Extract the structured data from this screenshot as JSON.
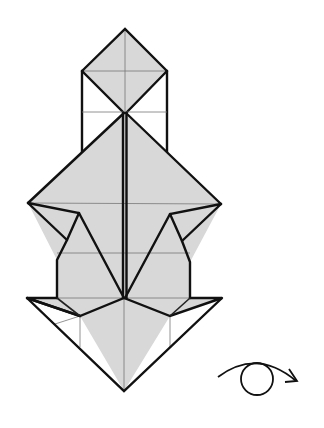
{
  "diagram": {
    "paper_fill": "#d8d8d8",
    "line_color": "#111111",
    "symbols": [
      {
        "name": "turn-over-symbol",
        "meaning": "turn model over (eye with arrow)"
      }
    ]
  }
}
